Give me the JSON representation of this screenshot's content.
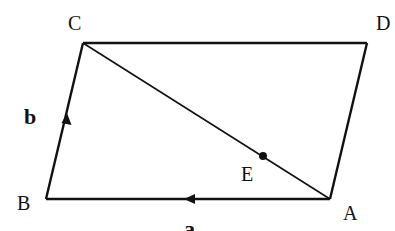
{
  "diagram": {
    "type": "parallelogram-vectors",
    "vertices": {
      "A": {
        "label": "A",
        "x": 330,
        "y": 199
      },
      "B": {
        "label": "B",
        "x": 46,
        "y": 199
      },
      "C": {
        "label": "C",
        "x": 83,
        "y": 43
      },
      "D": {
        "label": "D",
        "x": 367,
        "y": 43
      }
    },
    "point_E": {
      "label": "E",
      "x": 263,
      "y": 157,
      "on_segment": "AC"
    },
    "vectors": {
      "a": {
        "label": "a",
        "from": "A",
        "to": "B"
      },
      "b": {
        "label": "b",
        "from": "B",
        "to": "C"
      }
    },
    "edges": [
      "AB",
      "BC",
      "CD",
      "DA",
      "AC"
    ],
    "colors": {
      "stroke": "#111111",
      "background": "#ffffff"
    }
  }
}
